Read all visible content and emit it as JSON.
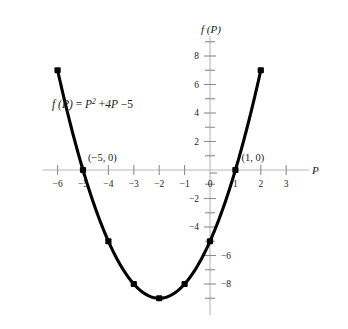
{
  "chart_data": {
    "type": "line",
    "title": "",
    "subtitle": "",
    "xlabel": "P",
    "ylabel": "f (P)",
    "equation_label": "f (P) = P² + 4P −5",
    "equation_parts": {
      "lhs": "f (P)",
      "equals": "=",
      "term1_base": "P",
      "term1_exp": "2",
      "plus": "+",
      "term2": "4P",
      "minus": "−",
      "constant": "5"
    },
    "x": [
      -6,
      -5,
      -4,
      -3,
      -2,
      -1,
      0,
      1,
      2
    ],
    "values": [
      7,
      0,
      -5,
      -8,
      -9,
      -8,
      -5,
      0,
      7
    ],
    "series": [
      {
        "name": "f (P) = P² + 4P −5",
        "values": [
          7,
          0,
          -5,
          -8,
          -9,
          -8,
          -5,
          0,
          7
        ]
      }
    ],
    "xlim": [
      -6.6,
      3.9
    ],
    "ylim": [
      -10.2,
      9.4
    ],
    "xticks": [
      -6,
      -5,
      -4,
      -3,
      -2,
      -1,
      0,
      1,
      2,
      3
    ],
    "xticklabels": [
      "−6",
      "−5",
      "−4",
      "−3",
      "−2",
      "−1",
      "0",
      "1",
      "2",
      "3"
    ],
    "yticks_major": [
      8,
      6,
      4,
      2,
      -2,
      -4,
      -6,
      -8
    ],
    "yticklabels_major": [
      "8",
      "6",
      "4",
      "2",
      "−2",
      "−4",
      "−6",
      "−8"
    ],
    "yticks_minor": [
      9,
      7,
      5,
      3,
      1,
      -1,
      -3,
      -5,
      -7,
      -9
    ],
    "ytick_label_side": {
      "8": "left",
      "6": "left",
      "4": "left",
      "2": "left",
      "-2": "left",
      "-4": "left",
      "-6": "right",
      "-8": "right"
    },
    "grid": false,
    "legend": false,
    "legend_position": "none",
    "annotations": [
      {
        "name": "root-left",
        "text": "(−5, 0)",
        "x": -5,
        "y": 0
      },
      {
        "name": "root-right",
        "text": "(1, 0)",
        "x": 1,
        "y": 0
      }
    ],
    "markers_shown": true,
    "colors": {
      "background": "#ffffff",
      "curve": "#000000",
      "marker": "#000000",
      "axis": "#b9b9b9",
      "tick": "#8d8d8d",
      "text": "#1a1a1a"
    }
  }
}
